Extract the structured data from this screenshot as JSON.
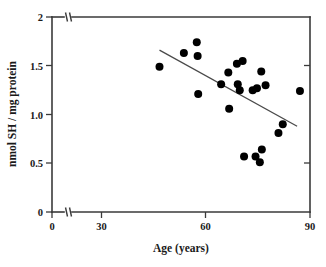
{
  "chart_data": {
    "type": "scatter",
    "title": "",
    "xlabel": "Age (years)",
    "ylabel": "nmol SH / mg protein",
    "xlim": [
      0,
      90
    ],
    "ylim": [
      0,
      2
    ],
    "xticks": [
      0,
      30,
      60,
      90
    ],
    "xtick_labels": [
      "0",
      "30",
      "60",
      "90"
    ],
    "yticks": [
      0,
      0.5,
      1.0,
      1.5,
      2
    ],
    "ytick_labels": [
      "0",
      "0.5",
      "1.0",
      "1.5",
      "2"
    ],
    "grid": false,
    "legend": false,
    "axis_break": {
      "axis": "x",
      "between": [
        0,
        30
      ],
      "note": "double slash break mark on both x-axis and top frame line"
    },
    "marker": {
      "shape": "circle",
      "color": "#000000",
      "size_px": 5.2
    },
    "points": [
      {
        "x": 37.5,
        "y": 1.49
      },
      {
        "x": 46.0,
        "y": 1.63
      },
      {
        "x": 50.5,
        "y": 1.74
      },
      {
        "x": 50.8,
        "y": 1.6
      },
      {
        "x": 51.0,
        "y": 1.21
      },
      {
        "x": 59.0,
        "y": 1.31
      },
      {
        "x": 61.5,
        "y": 1.43
      },
      {
        "x": 61.8,
        "y": 1.06
      },
      {
        "x": 64.5,
        "y": 1.52
      },
      {
        "x": 64.8,
        "y": 1.31
      },
      {
        "x": 65.5,
        "y": 1.25
      },
      {
        "x": 66.5,
        "y": 1.55
      },
      {
        "x": 67.0,
        "y": 0.57
      },
      {
        "x": 70.0,
        "y": 1.25
      },
      {
        "x": 71.0,
        "y": 0.57
      },
      {
        "x": 71.5,
        "y": 1.27
      },
      {
        "x": 72.5,
        "y": 0.51
      },
      {
        "x": 73.0,
        "y": 1.44
      },
      {
        "x": 73.2,
        "y": 0.64
      },
      {
        "x": 74.5,
        "y": 1.3
      },
      {
        "x": 79.0,
        "y": 0.81
      },
      {
        "x": 80.5,
        "y": 0.9
      },
      {
        "x": 86.5,
        "y": 1.24
      }
    ],
    "fit_line": {
      "type": "linear-regression",
      "x_start": 37.5,
      "y_start": 1.66,
      "x_end": 85.5,
      "y_end": 0.88
    }
  }
}
